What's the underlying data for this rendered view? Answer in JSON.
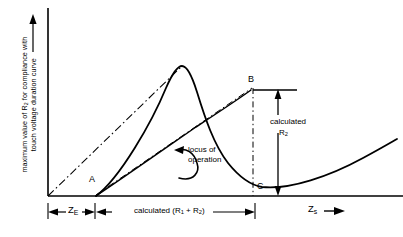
{
  "figure": {
    "type": "technical-line-diagram",
    "background_color": "#ffffff",
    "line_color": "#000000",
    "axes": {
      "y_label_line1": "maximum value of R",
      "y_label_sub1": "2",
      "y_label_line1_cont": " for compliance with",
      "y_label_line2": "touch voltage duration curve",
      "y_label_full": "maximum value of R2 for compliance with touch voltage duration curve",
      "y_arrow": "up",
      "x_label": "Z",
      "x_label_sub": "s",
      "x_arrow": "right"
    },
    "points": [
      {
        "id": "A",
        "label": "A",
        "x": 95,
        "y": 196,
        "description": "start of locus of operation on baseline"
      },
      {
        "id": "B",
        "label": "B",
        "x": 253,
        "y": 88,
        "description": "upper end of calculated R2 dimension"
      },
      {
        "id": "C",
        "label": "C",
        "x": 255,
        "y": 196,
        "description": "baseline foot below B"
      }
    ],
    "dimensions": [
      {
        "id": "ZE",
        "label": "Z",
        "label_sub": "E",
        "from_x": 48,
        "to_x": 95,
        "y": 212,
        "arrows": "both"
      },
      {
        "id": "R1R2",
        "label": "calculated (R",
        "sub1": "1",
        "mid": " + R",
        "sub2": "2",
        "close": ")",
        "label_full": "calculated (R1 + R2)",
        "from_x": 95,
        "to_x": 255,
        "y": 212,
        "arrows": "both"
      },
      {
        "id": "calcR2",
        "label_line1": "calculated",
        "label_line2": "R",
        "label_line2_sub": "2",
        "label_full": "calculated R2",
        "x": 278,
        "from_y": 90,
        "to_y": 196,
        "arrows": "both"
      }
    ],
    "annotations": [
      {
        "id": "locus",
        "line1": "locus of",
        "line2": "operation",
        "text": "locus of operation",
        "arrow_to_x": 182,
        "arrow_to_y": 152
      }
    ],
    "curves": [
      {
        "id": "main-curve",
        "style": "solid",
        "description": "rises from A to peak then falls and flattens, rising gently to the right"
      },
      {
        "id": "origin-to-peak",
        "style": "dash-dot",
        "description": "straight line from origin to curve peak"
      },
      {
        "id": "A-to-B",
        "style": "dash-dot",
        "description": "straight line from A to B"
      },
      {
        "id": "locus-line",
        "style": "solid",
        "description": "locus of operation line from A toward B"
      },
      {
        "id": "B-vertical",
        "style": "dash-dot",
        "description": "vertical line from B down through C to baseline"
      }
    ]
  }
}
